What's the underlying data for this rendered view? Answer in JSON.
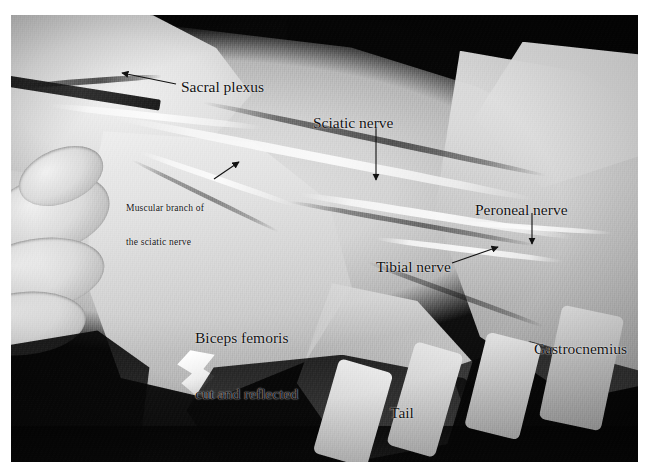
{
  "figure": {
    "kind": "anatomical-dissection-photograph",
    "rendering": "grayscale photograph",
    "photo_frame": {
      "x": 11,
      "y": 15,
      "width": 627,
      "height": 447
    },
    "canvas": {
      "width": 649,
      "height": 472
    },
    "background_color": "#ffffff",
    "ink_color": "#111111"
  },
  "labels": [
    {
      "id": "sacral-plexus",
      "text": "Sacral plexus",
      "size": "big",
      "x": 181,
      "y": 78,
      "pointer": {
        "type": "arrow",
        "from_x": 176,
        "from_y": 84,
        "to_x": 122,
        "to_y": 73
      }
    },
    {
      "id": "muscular-branch",
      "text": "Muscular branch of\nthe sciatic nerve",
      "line1": "Muscular branch of",
      "line2": "the sciatic nerve",
      "size": "small",
      "x": 126,
      "y": 180,
      "pointer": {
        "type": "arrow",
        "from_x": 214,
        "from_y": 179,
        "to_x": 239,
        "to_y": 162
      }
    },
    {
      "id": "sciatic-nerve",
      "text": "Sciatic nerve",
      "size": "big",
      "x": 313,
      "y": 114,
      "pointer": {
        "type": "arrow",
        "from_x": 376,
        "from_y": 128,
        "to_x": 376,
        "to_y": 178
      }
    },
    {
      "id": "peroneal-nerve",
      "text": "Peroneal nerve",
      "size": "big",
      "x": 475,
      "y": 201,
      "pointer": {
        "type": "arrow",
        "from_x": 532,
        "from_y": 213,
        "to_x": 532,
        "to_y": 242
      }
    },
    {
      "id": "tibial-nerve",
      "text": "Tibial nerve",
      "size": "big",
      "x": 376,
      "y": 258,
      "pointer": {
        "type": "arrow",
        "from_x": 452,
        "from_y": 263,
        "to_x": 497,
        "to_y": 248
      }
    },
    {
      "id": "biceps-femoris",
      "text": "Biceps femoris\ncut and reflected",
      "line1": "Biceps femoris",
      "line2": "cut and reflected",
      "size": "big",
      "x": 195,
      "y": 292,
      "pointer": null
    },
    {
      "id": "gastrocnemius",
      "text": "Gastrocnemius",
      "size": "big",
      "x": 534,
      "y": 340,
      "pointer": null
    },
    {
      "id": "tail",
      "text": "Tail",
      "size": "big",
      "x": 390,
      "y": 404,
      "pointer": null
    }
  ]
}
